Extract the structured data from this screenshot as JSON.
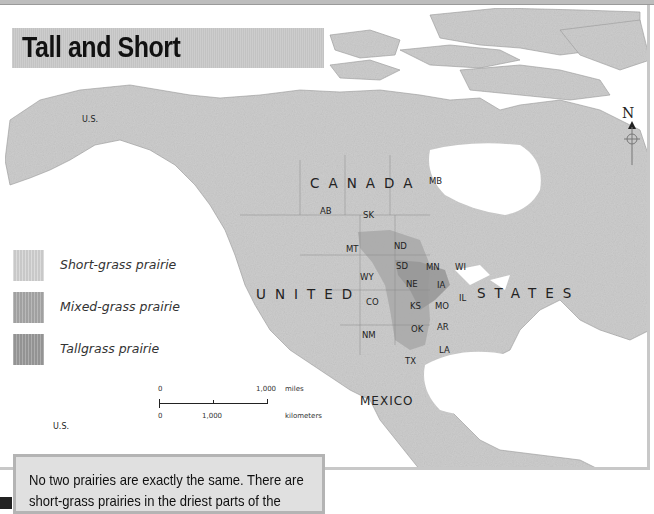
{
  "title": "Tall and Short",
  "legend": {
    "items": [
      {
        "label": "Short-grass prairie",
        "color": "#d2d2d2"
      },
      {
        "label": "Mixed-grass prairie",
        "color": "#a8a8a8"
      },
      {
        "label": "Tallgrass prairie",
        "color": "#9a9a9a"
      }
    ]
  },
  "map": {
    "countries": {
      "canada": "CANADA",
      "united": "UNITED",
      "states": "STATES",
      "mexico": "MEXICO"
    },
    "us_alaska": "U.S.",
    "us_hawaii": "U.S.",
    "provinces": {
      "ab": "AB",
      "sk": "SK",
      "mb": "MB"
    },
    "states": {
      "mt": "MT",
      "nd": "ND",
      "sd": "SD",
      "wy": "WY",
      "ne": "NE",
      "co": "CO",
      "ks": "KS",
      "nm": "NM",
      "ok": "OK",
      "tx": "TX",
      "mn": "MN",
      "wi": "WI",
      "ia": "IA",
      "il": "IL",
      "mo": "MO",
      "ar": "AR",
      "la": "LA"
    },
    "colors": {
      "land": "#cfcfcf",
      "water": "#ffffff",
      "mixed_grass": "#a8a8a8",
      "tallgrass": "#999999",
      "border": "#8a8a8a"
    }
  },
  "scale_bar": {
    "miles_start": "0",
    "miles_end": "1,000",
    "miles_unit": "miles",
    "km_start": "0",
    "km_mid": "1,000",
    "km_unit": "kilometers"
  },
  "compass": {
    "north_label": "N"
  },
  "text_box": {
    "line1": "No two prairies are exactly the same. There are",
    "line2": "short-grass prairies in the driest parts of the"
  }
}
